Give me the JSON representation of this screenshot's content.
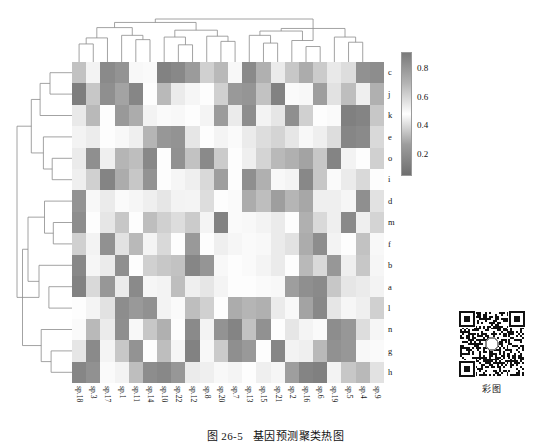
{
  "figure": {
    "number": "图 26-5",
    "title": "基因预测聚类热图",
    "qr_caption": "彩图",
    "qr_icon": "qr-code-icon"
  },
  "colorbar": {
    "ticks": [
      "0.8",
      "0.6",
      "0.4",
      "0.2"
    ],
    "tick_values": [
      0.8,
      0.6,
      0.4,
      0.2
    ],
    "vmin": 0.05,
    "vmax": 0.92,
    "gradient_stops": [
      "#6f6f6f",
      "#9d9d9d",
      "#ffffff",
      "#b4b4b4",
      "#7a7a7a"
    ]
  },
  "chart_data": {
    "type": "heatmap",
    "title": "基因预测聚类热图",
    "xlabel": "",
    "ylabel": "",
    "colormap": "grayscale-diverging",
    "zlim": [
      0.05,
      0.92
    ],
    "grid": false,
    "legend": "colorbar-right",
    "row_labels": [
      "c",
      "j",
      "k",
      "e",
      "o",
      "i",
      "d",
      "m",
      "f",
      "b",
      "a",
      "l",
      "n",
      "g",
      "h"
    ],
    "col_labels": [
      "sp.18",
      "sp.3",
      "sp.17",
      "sp.1",
      "sp.11",
      "sp.14",
      "sp.10",
      "sp.22",
      "sp.12",
      "sp.8",
      "sp.20",
      "sp.7",
      "sp.13",
      "sp.15",
      "sp.21",
      "sp.2",
      "sp.16",
      "sp.6",
      "sp.19",
      "sp.5",
      "sp.4",
      "sp.9"
    ],
    "values": [
      [
        0.35,
        0.52,
        0.18,
        0.22,
        0.47,
        0.5,
        0.14,
        0.17,
        0.26,
        0.38,
        0.33,
        0.47,
        0.18,
        0.31,
        0.44,
        0.36,
        0.3,
        0.37,
        0.55,
        0.41,
        0.21,
        0.19
      ],
      [
        0.12,
        0.36,
        0.2,
        0.28,
        0.16,
        0.48,
        0.33,
        0.44,
        0.51,
        0.49,
        0.38,
        0.25,
        0.23,
        0.35,
        0.14,
        0.5,
        0.47,
        0.27,
        0.42,
        0.34,
        0.45,
        0.31
      ],
      [
        0.55,
        0.33,
        0.48,
        0.25,
        0.3,
        0.52,
        0.5,
        0.47,
        0.49,
        0.46,
        0.26,
        0.44,
        0.19,
        0.52,
        0.43,
        0.2,
        0.38,
        0.48,
        0.5,
        0.13,
        0.15,
        0.36
      ],
      [
        0.52,
        0.54,
        0.49,
        0.47,
        0.45,
        0.32,
        0.24,
        0.22,
        0.43,
        0.48,
        0.46,
        0.5,
        0.44,
        0.41,
        0.39,
        0.43,
        0.47,
        0.45,
        0.41,
        0.16,
        0.18,
        0.4
      ],
      [
        0.44,
        0.2,
        0.53,
        0.32,
        0.34,
        0.17,
        0.49,
        0.21,
        0.35,
        0.18,
        0.37,
        0.48,
        0.53,
        0.39,
        0.33,
        0.31,
        0.28,
        0.36,
        0.15,
        0.52,
        0.49,
        0.38
      ],
      [
        0.53,
        0.38,
        0.15,
        0.3,
        0.36,
        0.22,
        0.49,
        0.51,
        0.45,
        0.4,
        0.27,
        0.48,
        0.2,
        0.31,
        0.47,
        0.46,
        0.17,
        0.36,
        0.5,
        0.44,
        0.4,
        0.49
      ],
      [
        0.22,
        0.47,
        0.44,
        0.5,
        0.51,
        0.45,
        0.43,
        0.52,
        0.46,
        0.41,
        0.48,
        0.5,
        0.3,
        0.34,
        0.27,
        0.32,
        0.29,
        0.45,
        0.53,
        0.51,
        0.2,
        0.42
      ],
      [
        0.19,
        0.49,
        0.43,
        0.36,
        0.48,
        0.34,
        0.38,
        0.41,
        0.37,
        0.46,
        0.14,
        0.5,
        0.47,
        0.52,
        0.44,
        0.48,
        0.31,
        0.4,
        0.53,
        0.18,
        0.45,
        0.39
      ],
      [
        0.38,
        0.52,
        0.21,
        0.42,
        0.33,
        0.46,
        0.4,
        0.49,
        0.25,
        0.48,
        0.45,
        0.51,
        0.5,
        0.47,
        0.44,
        0.42,
        0.3,
        0.19,
        0.52,
        0.49,
        0.35,
        0.47
      ],
      [
        0.17,
        0.51,
        0.44,
        0.2,
        0.49,
        0.38,
        0.36,
        0.35,
        0.16,
        0.23,
        0.47,
        0.48,
        0.5,
        0.46,
        0.44,
        0.49,
        0.33,
        0.4,
        0.24,
        0.45,
        0.36,
        0.51
      ],
      [
        0.14,
        0.4,
        0.24,
        0.44,
        0.18,
        0.51,
        0.52,
        0.34,
        0.45,
        0.43,
        0.46,
        0.48,
        0.49,
        0.5,
        0.47,
        0.27,
        0.2,
        0.18,
        0.36,
        0.43,
        0.44,
        0.52
      ],
      [
        0.49,
        0.46,
        0.42,
        0.19,
        0.25,
        0.21,
        0.52,
        0.5,
        0.34,
        0.38,
        0.48,
        0.3,
        0.32,
        0.31,
        0.44,
        0.47,
        0.28,
        0.17,
        0.43,
        0.51,
        0.45,
        0.38
      ],
      [
        0.5,
        0.33,
        0.44,
        0.2,
        0.47,
        0.36,
        0.31,
        0.49,
        0.18,
        0.52,
        0.22,
        0.15,
        0.35,
        0.21,
        0.48,
        0.43,
        0.46,
        0.5,
        0.19,
        0.24,
        0.41,
        0.51
      ],
      [
        0.43,
        0.18,
        0.46,
        0.36,
        0.22,
        0.48,
        0.34,
        0.51,
        0.14,
        0.47,
        0.37,
        0.2,
        0.25,
        0.49,
        0.16,
        0.52,
        0.45,
        0.33,
        0.21,
        0.24,
        0.47,
        0.5
      ],
      [
        0.16,
        0.21,
        0.5,
        0.52,
        0.34,
        0.19,
        0.17,
        0.24,
        0.44,
        0.53,
        0.47,
        0.46,
        0.49,
        0.45,
        0.51,
        0.27,
        0.15,
        0.13,
        0.52,
        0.36,
        0.33,
        0.42
      ]
    ]
  },
  "col_dendrogram": {
    "leaf_count": 22,
    "links": [
      {
        "x1": 0.5,
        "x2": 1.5,
        "h": 0.42
      },
      {
        "x1": 1.0,
        "x2": 2.5,
        "h": 0.56
      },
      {
        "x1": 4.5,
        "x2": 5.5,
        "h": 0.52
      },
      {
        "x1": 3.5,
        "x2": 5.0,
        "h": 0.62
      },
      {
        "x1": 1.75,
        "x2": 4.25,
        "h": 0.8
      },
      {
        "x1": 7.5,
        "x2": 8.5,
        "h": 0.4
      },
      {
        "x1": 6.5,
        "x2": 8.0,
        "h": 0.58
      },
      {
        "x1": 10.5,
        "x2": 11.5,
        "h": 0.48
      },
      {
        "x1": 9.5,
        "x2": 11.0,
        "h": 0.6
      },
      {
        "x1": 7.25,
        "x2": 10.25,
        "h": 0.74
      },
      {
        "x1": 3.0,
        "x2": 8.75,
        "h": 0.92
      },
      {
        "x1": 13.5,
        "x2": 14.5,
        "h": 0.44
      },
      {
        "x1": 12.5,
        "x2": 14.0,
        "h": 0.62
      },
      {
        "x1": 16.5,
        "x2": 17.5,
        "h": 0.36
      },
      {
        "x1": 15.5,
        "x2": 17.0,
        "h": 0.5
      },
      {
        "x1": 13.25,
        "x2": 16.25,
        "h": 0.72
      },
      {
        "x1": 19.5,
        "x2": 20.5,
        "h": 0.46
      },
      {
        "x1": 18.5,
        "x2": 20.0,
        "h": 0.58
      },
      {
        "x1": 14.75,
        "x2": 19.25,
        "h": 0.78
      },
      {
        "x1": 5.875,
        "x2": 17.0,
        "h": 1.0
      }
    ]
  },
  "row_dendrogram": {
    "leaf_count": 15,
    "links": [
      {
        "y1": 0.5,
        "y2": 1.5,
        "h": 0.4
      },
      {
        "y1": 1.0,
        "y2": 2.5,
        "h": 0.58
      },
      {
        "y1": 4.5,
        "y2": 5.5,
        "h": 0.36
      },
      {
        "y1": 3.5,
        "y2": 5.0,
        "h": 0.52
      },
      {
        "y1": 1.75,
        "y2": 4.25,
        "h": 0.74
      },
      {
        "y1": 7.5,
        "y2": 8.5,
        "h": 0.34
      },
      {
        "y1": 6.5,
        "y2": 8.0,
        "h": 0.5
      },
      {
        "y1": 10.5,
        "y2": 11.5,
        "h": 0.42
      },
      {
        "y1": 9.5,
        "y2": 11.0,
        "h": 0.6
      },
      {
        "y1": 7.25,
        "y2": 10.25,
        "h": 0.8
      },
      {
        "y1": 13.5,
        "y2": 14.5,
        "h": 0.38
      },
      {
        "y1": 12.5,
        "y2": 14.0,
        "h": 0.56
      },
      {
        "y1": 8.75,
        "y2": 13.25,
        "h": 0.9
      },
      {
        "y1": 3.0,
        "y2": 11.0,
        "h": 1.0
      }
    ]
  }
}
